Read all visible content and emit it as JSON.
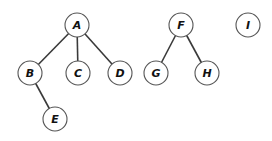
{
  "diagram": {
    "type": "forest",
    "node_radius": 12,
    "nodes": [
      {
        "id": "A",
        "label": "A",
        "x": 77,
        "y": 25
      },
      {
        "id": "B",
        "label": "B",
        "x": 30,
        "y": 73
      },
      {
        "id": "C",
        "label": "C",
        "x": 78,
        "y": 73
      },
      {
        "id": "D",
        "label": "D",
        "x": 120,
        "y": 73
      },
      {
        "id": "E",
        "label": "E",
        "x": 55,
        "y": 119
      },
      {
        "id": "F",
        "label": "F",
        "x": 181,
        "y": 25
      },
      {
        "id": "G",
        "label": "G",
        "x": 156,
        "y": 73
      },
      {
        "id": "H",
        "label": "H",
        "x": 207,
        "y": 73
      },
      {
        "id": "I",
        "label": "I",
        "x": 248,
        "y": 25
      }
    ],
    "edges": [
      {
        "from": "A",
        "to": "B"
      },
      {
        "from": "A",
        "to": "C"
      },
      {
        "from": "A",
        "to": "D"
      },
      {
        "from": "B",
        "to": "E"
      },
      {
        "from": "F",
        "to": "G"
      },
      {
        "from": "F",
        "to": "H"
      }
    ]
  }
}
